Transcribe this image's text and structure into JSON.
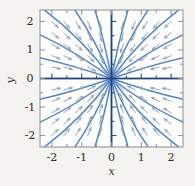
{
  "figure": {
    "background_color": "#f5f3f0",
    "frame_color": "#8a8f96",
    "axis_color": "#27416b",
    "curve_color": "#4a7fc1",
    "arrow_color": "#9aa6b4",
    "text_color": "#2b2b2b"
  },
  "axes": {
    "x_title": "x",
    "y_title": "y",
    "x_ticklabels": [
      "-2",
      "-1",
      "0",
      "1",
      "2"
    ],
    "y_ticklabels": [
      "2",
      "1",
      "0",
      "-1",
      "-2"
    ]
  },
  "chart_data": {
    "type": "scatter",
    "title": "",
    "subtitle": "",
    "xlabel": "x",
    "ylabel": "y",
    "xlim": [
      -2.4,
      2.4
    ],
    "ylim": [
      -2.4,
      2.4
    ],
    "grid": false,
    "legend": null,
    "plot_kind": "direction-field-with-trajectories",
    "xticks": [
      -2,
      -1,
      0,
      1,
      2
    ],
    "yticks": [
      -2,
      -1,
      0,
      1,
      2
    ],
    "xminorticks": [
      -2.0,
      -1.5,
      -1.0,
      -0.5,
      0.0,
      0.5,
      1.0,
      1.5,
      2.0
    ],
    "yminorticks": [
      -2.0,
      -1.5,
      -1.0,
      -0.5,
      0.0,
      0.5,
      1.0,
      1.5,
      2.0
    ],
    "equilibrium_point": {
      "x": 0,
      "y": 0,
      "classification": "stable node (sink)"
    },
    "vector_field": {
      "u_expression": "-x",
      "v_expression": "-y",
      "normalized": true,
      "grid_x": [
        -2.0,
        -1.6,
        -1.2,
        -0.8,
        -0.4,
        0.4,
        0.8,
        1.2,
        1.6,
        2.0
      ],
      "grid_y": [
        -2.0,
        -1.6,
        -1.2,
        -0.8,
        -0.4,
        0.4,
        0.8,
        1.2,
        1.6,
        2.0
      ]
    },
    "trajectories": {
      "family": "radial lines through origin",
      "count": 24,
      "angles_deg": [
        0,
        15,
        30,
        45,
        60,
        75,
        90,
        105,
        120,
        135,
        150,
        165,
        180,
        195,
        210,
        225,
        240,
        255,
        270,
        285,
        300,
        315,
        330,
        345
      ],
      "flow_direction": "inward"
    },
    "series": [
      {
        "name": "solution trajectories",
        "color": "#4a7fc1",
        "values": []
      },
      {
        "name": "direction field arrows",
        "color": "#9aa6b4",
        "values": []
      }
    ]
  }
}
